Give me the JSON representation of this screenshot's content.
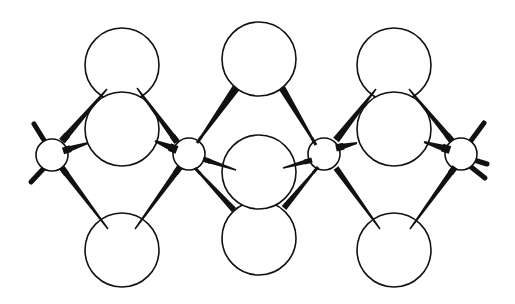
{
  "diagram": {
    "type": "ball-and-stick molecular structure (chain of edge-sharing tetrahedra)",
    "colors": {
      "stroke": "#111111",
      "fill": "#ffffff",
      "background": "#ffffff"
    },
    "large_atoms": [
      {
        "id": "L1-top",
        "cx": 122,
        "cy": 65,
        "r": 37
      },
      {
        "id": "L1-mid",
        "cx": 122,
        "cy": 129,
        "r": 37
      },
      {
        "id": "L1-bottom",
        "cx": 122,
        "cy": 250,
        "r": 37
      },
      {
        "id": "L2-top",
        "cx": 259,
        "cy": 59,
        "r": 37
      },
      {
        "id": "L2-mid",
        "cx": 259,
        "cy": 172,
        "r": 37
      },
      {
        "id": "L2-bottom",
        "cx": 259,
        "cy": 238,
        "r": 37
      },
      {
        "id": "L3-top",
        "cx": 394,
        "cy": 65,
        "r": 37
      },
      {
        "id": "L3-mid",
        "cx": 394,
        "cy": 129,
        "r": 37
      },
      {
        "id": "L3-bottom",
        "cx": 394,
        "cy": 250,
        "r": 37
      }
    ],
    "small_atoms": [
      {
        "id": "S1",
        "cx": 52,
        "cy": 155,
        "r": 16
      },
      {
        "id": "S2",
        "cx": 189,
        "cy": 154,
        "r": 16
      },
      {
        "id": "S3",
        "cx": 324,
        "cy": 154,
        "r": 16
      },
      {
        "id": "S4",
        "cx": 461,
        "cy": 154,
        "r": 16
      }
    ],
    "wedge_bonds": [
      {
        "x1": 62,
        "y1": 141,
        "x2": 107,
        "y2": 89,
        "w1": 7,
        "w2": 1.5
      },
      {
        "x1": 63,
        "y1": 151,
        "x2": 88,
        "y2": 143,
        "w1": 7,
        "w2": 2
      },
      {
        "x1": 62,
        "y1": 168,
        "x2": 108,
        "y2": 229,
        "w1": 6,
        "w2": 1.5
      },
      {
        "x1": 177,
        "y1": 142,
        "x2": 137,
        "y2": 88,
        "w1": 6,
        "w2": 1.5
      },
      {
        "x1": 177,
        "y1": 150,
        "x2": 155,
        "y2": 141,
        "w1": 8,
        "w2": 2
      },
      {
        "x1": 180,
        "y1": 167,
        "x2": 135,
        "y2": 229,
        "w1": 6,
        "w2": 1.5
      },
      {
        "x1": 197,
        "y1": 143,
        "x2": 236,
        "y2": 88,
        "w1": 2,
        "w2": 8
      },
      {
        "x1": 203,
        "y1": 159,
        "x2": 236,
        "y2": 170,
        "w1": 5,
        "w2": 1.5
      },
      {
        "x1": 195,
        "y1": 168,
        "x2": 234,
        "y2": 210,
        "w1": 2,
        "w2": 6
      },
      {
        "x1": 316,
        "y1": 145,
        "x2": 282,
        "y2": 88,
        "w1": 2,
        "w2": 7
      },
      {
        "x1": 312,
        "y1": 160,
        "x2": 283,
        "y2": 168,
        "w1": 5,
        "w2": 1.5
      },
      {
        "x1": 318,
        "y1": 167,
        "x2": 284,
        "y2": 208,
        "w1": 2,
        "w2": 6
      },
      {
        "x1": 336,
        "y1": 140,
        "x2": 376,
        "y2": 89,
        "w1": 7,
        "w2": 1.5
      },
      {
        "x1": 336,
        "y1": 148,
        "x2": 357,
        "y2": 143,
        "w1": 7,
        "w2": 2
      },
      {
        "x1": 336,
        "y1": 168,
        "x2": 380,
        "y2": 229,
        "w1": 6,
        "w2": 1.5
      },
      {
        "x1": 452,
        "y1": 141,
        "x2": 409,
        "y2": 89,
        "w1": 6,
        "w2": 1.5
      },
      {
        "x1": 450,
        "y1": 150,
        "x2": 424,
        "y2": 142,
        "w1": 8,
        "w2": 2
      },
      {
        "x1": 455,
        "y1": 167,
        "x2": 410,
        "y2": 229,
        "w1": 6,
        "w2": 1.5
      }
    ],
    "stub_bonds": [
      {
        "x1": 47,
        "y1": 145,
        "x2": 34,
        "y2": 124,
        "w": 5
      },
      {
        "x1": 45,
        "y1": 167,
        "x2": 31,
        "y2": 182,
        "w": 5
      },
      {
        "x1": 470,
        "y1": 142,
        "x2": 484,
        "y2": 123,
        "w": 5
      },
      {
        "x1": 474,
        "y1": 160,
        "x2": 487,
        "y2": 164,
        "w": 5
      },
      {
        "x1": 471,
        "y1": 167,
        "x2": 485,
        "y2": 178,
        "w": 5
      }
    ]
  }
}
